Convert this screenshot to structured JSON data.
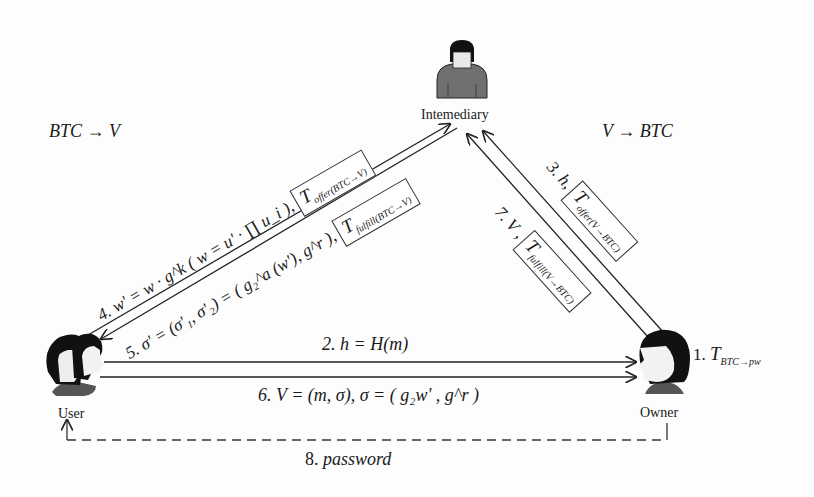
{
  "diagram": {
    "type": "protocol-flow",
    "direction_labels": {
      "left": "BTC → V",
      "right": "V → BTC"
    },
    "actors": {
      "intermediary": {
        "label": "Intemediary"
      },
      "user": {
        "label": "User"
      },
      "owner": {
        "label": "Owner"
      }
    },
    "messages": {
      "step1": {
        "prefix": "1.",
        "T": "T",
        "sub": "BTC→pw"
      },
      "step2": {
        "text": "2. h = H(m)"
      },
      "step3": {
        "prefix": "3. h,",
        "T": "T",
        "sub": "offer(V→BTC)"
      },
      "step4": {
        "text": "4. w' = w · g^k ( w = u' · ∏ u_i ),",
        "product_index": "i∈A",
        "T": "T",
        "sub": "offer(BTC→V)"
      },
      "step5": {
        "text": "5. σ' = (σ'₁, σ'₂) = ( g₂^a (w'), g^r ),",
        "T": "T",
        "sub": "fulfill(BTC→V)"
      },
      "step6": {
        "text": "6. V = (m, σ), σ = ( g₂w' , g^r )"
      },
      "step7": {
        "prefix": "7. V ,",
        "T": "T",
        "sub": "fulfill(V→BTC)"
      },
      "step8": {
        "prefix": "8.",
        "text": "password"
      }
    }
  }
}
